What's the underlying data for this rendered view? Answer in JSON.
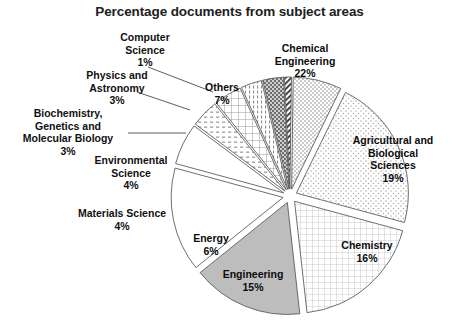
{
  "chart": {
    "title": "Percentage documents from subject areas"
  },
  "chart_data": {
    "type": "pie",
    "title": "Percentage documents from subject areas",
    "xlabel": "",
    "ylabel": "",
    "legend": "none",
    "grid": false,
    "unit": "%",
    "exploded": true,
    "labels": [
      "Chemical Engineering",
      "Agricultural and Biological Sciences",
      "Chemistry",
      "Engineering",
      "Energy",
      "Materials Science",
      "Environmental Science",
      "Biochemistry, Genetics and Molecular Biology",
      "Physics and Astronomy",
      "Computer Science",
      "Others"
    ],
    "values": [
      22,
      19,
      16,
      15,
      6,
      4,
      4,
      3,
      3,
      1,
      7
    ],
    "slices": [
      {
        "name": "chemical-engineering",
        "label_line1": "Chemical",
        "label_line2": "Engineering",
        "value_text": "22%",
        "value": 22,
        "pattern": "sparse-dots",
        "fill": "#fdfdfd"
      },
      {
        "name": "agricultural-biological-sciences",
        "label_line1": "Agricultural and",
        "label_line2": "Biological",
        "label_line3": "Sciences",
        "value_text": "19%",
        "value": 19,
        "pattern": "fine-grid",
        "fill": "#ffffff"
      },
      {
        "name": "chemistry",
        "label_line1": "Chemistry",
        "value_text": "16%",
        "value": 16,
        "pattern": "solid-gray",
        "fill": "#bdbdbd"
      },
      {
        "name": "engineering",
        "label_line1": "Engineering",
        "value_text": "15%",
        "value": 15,
        "pattern": "none",
        "fill": "#ffffff"
      },
      {
        "name": "energy",
        "label_line1": "Energy",
        "value_text": "6%",
        "value": 6,
        "pattern": "none",
        "fill": "#fefefe"
      },
      {
        "name": "materials-science",
        "label_line1": "Materials Science",
        "value_text": "4%",
        "value": 4,
        "pattern": "dashed-rows",
        "fill": "#ffffff"
      },
      {
        "name": "environmental-science",
        "label_line1": "Environmental",
        "label_line2": "Science",
        "value_text": "4%",
        "value": 4,
        "pattern": "coarse-grid",
        "fill": "#ffffff"
      },
      {
        "name": "biochemistry-genetics-molecular-biology",
        "label_line1": "Biochemistry,",
        "label_line2": "Genetics and",
        "label_line3": "Molecular Biology",
        "value_text": "3%",
        "value": 3,
        "pattern": "vertical-ticks",
        "fill": "#ffffff"
      },
      {
        "name": "physics-and-astronomy",
        "label_line1": "Physics and",
        "label_line2": "Astronomy",
        "value_text": "3%",
        "value": 3,
        "pattern": "dark-dots",
        "fill": "#6e6e6e"
      },
      {
        "name": "computer-science",
        "label_line1": "Computer",
        "label_line2": "Science",
        "value_text": "1%",
        "value": 1,
        "pattern": "diagonal-hatch",
        "fill": "#ffffff"
      },
      {
        "name": "others",
        "label_line1": "Others",
        "value_text": "7%",
        "value": 7,
        "pattern": "medium-dots",
        "fill": "#fbfbfb"
      }
    ],
    "colors": {
      "outline": "#555555",
      "text": "#111111",
      "chemistry_fill": "#bdbdbd",
      "physics_fill": "#6e6e6e",
      "background": "#ffffff"
    }
  }
}
